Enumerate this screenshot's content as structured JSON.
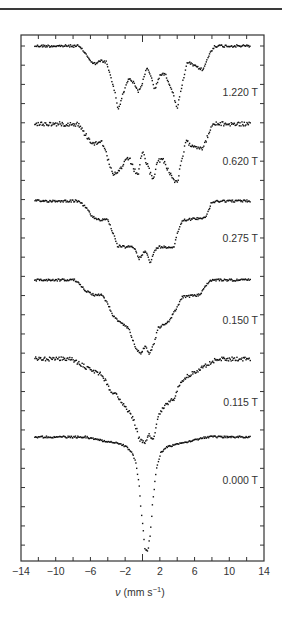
{
  "chart_data": {
    "type": "scatter",
    "title": "",
    "xlabel": "ν (mm s⁻¹)",
    "xlabel_parts": {
      "symbol": "ν",
      "unit_open": " (mm s",
      "exponent": "−1",
      "unit_close": ")"
    },
    "ylabel": "",
    "xlim": [
      -14,
      14
    ],
    "x_ticks": [
      -14,
      -10,
      -6,
      -2,
      2,
      6,
      10,
      14
    ],
    "x_tick_labels": [
      "−14",
      "−10",
      "−6",
      "−2",
      "2",
      "6",
      "10",
      "14"
    ],
    "x_minor_ticks": [
      -12,
      -10,
      -8,
      -6,
      -4,
      -2,
      0,
      2,
      4,
      6,
      8,
      10,
      12
    ],
    "grid": false,
    "legend_position": "inline-right",
    "y_tick_count": 27,
    "series": [
      {
        "name": "1.220 T",
        "baseline_px": 46,
        "label_y_px": 92,
        "profile": [
          [
            -12.5,
            0
          ],
          [
            -7.4,
            0
          ],
          [
            -6.8,
            5
          ],
          [
            -6.2,
            12
          ],
          [
            -5.7,
            18
          ],
          [
            -5.3,
            17
          ],
          [
            -4.8,
            15
          ],
          [
            -4.2,
            16
          ],
          [
            -3.7,
            30
          ],
          [
            -3.2,
            45
          ],
          [
            -2.8,
            64
          ],
          [
            -2.4,
            52
          ],
          [
            -1.6,
            32
          ],
          [
            -1.0,
            37
          ],
          [
            -0.5,
            46
          ],
          [
            0,
            37
          ],
          [
            0.5,
            22
          ],
          [
            1.0,
            30
          ],
          [
            1.4,
            44
          ],
          [
            2.0,
            29
          ],
          [
            2.6,
            28
          ],
          [
            3.4,
            44
          ],
          [
            4.0,
            62
          ],
          [
            4.3,
            50
          ],
          [
            4.7,
            34
          ],
          [
            5.2,
            16
          ],
          [
            6.0,
            20
          ],
          [
            7.0,
            24
          ],
          [
            7.6,
            10
          ],
          [
            8.3,
            0
          ],
          [
            12.5,
            0
          ]
        ],
        "noise": 1.2
      },
      {
        "name": "0.620 T",
        "baseline_px": 124,
        "label_y_px": 161,
        "profile": [
          [
            -12.5,
            0
          ],
          [
            -7.4,
            0
          ],
          [
            -6.8,
            8
          ],
          [
            -6.0,
            17
          ],
          [
            -5.4,
            20
          ],
          [
            -4.8,
            16
          ],
          [
            -4.3,
            24
          ],
          [
            -3.9,
            38
          ],
          [
            -3.4,
            52
          ],
          [
            -2.8,
            48
          ],
          [
            -2.0,
            38
          ],
          [
            -1.5,
            34
          ],
          [
            -1.0,
            46
          ],
          [
            -0.5,
            50
          ],
          [
            0,
            28
          ],
          [
            0.5,
            40
          ],
          [
            1.2,
            56
          ],
          [
            1.8,
            36
          ],
          [
            2.4,
            36
          ],
          [
            3.2,
            50
          ],
          [
            4.0,
            60
          ],
          [
            4.5,
            38
          ],
          [
            5.0,
            18
          ],
          [
            6.0,
            22
          ],
          [
            7.0,
            24
          ],
          [
            7.6,
            10
          ],
          [
            8.2,
            0
          ],
          [
            12.5,
            0
          ]
        ],
        "noise": 2.2
      },
      {
        "name": "0.275 T",
        "baseline_px": 201,
        "label_y_px": 238,
        "profile": [
          [
            -12.5,
            0
          ],
          [
            -7.5,
            0
          ],
          [
            -6.5,
            6
          ],
          [
            -5.8,
            16
          ],
          [
            -4.8,
            19
          ],
          [
            -4.0,
            18
          ],
          [
            -3.4,
            32
          ],
          [
            -2.9,
            45
          ],
          [
            -2.0,
            46
          ],
          [
            -1.0,
            46
          ],
          [
            -0.4,
            58
          ],
          [
            0.3,
            49
          ],
          [
            0.9,
            62
          ],
          [
            1.4,
            50
          ],
          [
            1.8,
            46
          ],
          [
            3.6,
            46
          ],
          [
            4.1,
            30
          ],
          [
            4.6,
            19
          ],
          [
            6.0,
            18
          ],
          [
            7.3,
            16
          ],
          [
            7.9,
            3
          ],
          [
            8.5,
            0
          ],
          [
            12.5,
            0
          ]
        ],
        "noise": 1.1
      },
      {
        "name": "0.150 T",
        "baseline_px": 280,
        "label_y_px": 320,
        "profile": [
          [
            -12.5,
            0
          ],
          [
            -7.8,
            0
          ],
          [
            -6.6,
            10
          ],
          [
            -5.6,
            15
          ],
          [
            -4.6,
            15
          ],
          [
            -4.0,
            24
          ],
          [
            -3.4,
            36
          ],
          [
            -2.4,
            44
          ],
          [
            -1.6,
            48
          ],
          [
            -0.8,
            68
          ],
          [
            -0.2,
            74
          ],
          [
            0.3,
            66
          ],
          [
            0.8,
            74
          ],
          [
            1.3,
            64
          ],
          [
            1.8,
            48
          ],
          [
            3.0,
            42
          ],
          [
            3.8,
            30
          ],
          [
            4.6,
            17
          ],
          [
            6.6,
            15
          ],
          [
            7.2,
            6
          ],
          [
            8.0,
            0
          ],
          [
            12.5,
            0
          ]
        ],
        "noise": 1.1
      },
      {
        "name": "0.115 T",
        "baseline_px": 359,
        "label_y_px": 402,
        "profile": [
          [
            -12.5,
            0
          ],
          [
            -8.2,
            0
          ],
          [
            -6.6,
            8
          ],
          [
            -4.6,
            16
          ],
          [
            -3.8,
            30
          ],
          [
            -2.8,
            38
          ],
          [
            -1.8,
            50
          ],
          [
            -1.0,
            60
          ],
          [
            -0.4,
            80
          ],
          [
            0.2,
            84
          ],
          [
            0.7,
            76
          ],
          [
            1.3,
            80
          ],
          [
            1.8,
            58
          ],
          [
            2.6,
            46
          ],
          [
            3.6,
            40
          ],
          [
            4.4,
            22
          ],
          [
            5.4,
            16
          ],
          [
            7.0,
            8
          ],
          [
            8.6,
            0
          ],
          [
            12.5,
            0
          ]
        ],
        "noise": 2.0
      },
      {
        "name": "0.000 T",
        "baseline_px": 437,
        "label_y_px": 480,
        "profile": [
          [
            -12.5,
            0
          ],
          [
            -6.5,
            0
          ],
          [
            -5.0,
            3
          ],
          [
            -3.0,
            6
          ],
          [
            -2.0,
            9
          ],
          [
            -1.3,
            14
          ],
          [
            -0.8,
            24
          ],
          [
            -0.4,
            48
          ],
          [
            -0.1,
            78
          ],
          [
            0.3,
            112
          ],
          [
            0.6,
            115
          ],
          [
            0.9,
            96
          ],
          [
            1.2,
            62
          ],
          [
            1.6,
            32
          ],
          [
            2.1,
            16
          ],
          [
            2.8,
            10
          ],
          [
            4.0,
            7
          ],
          [
            6.0,
            3
          ],
          [
            7.5,
            0
          ],
          [
            12.5,
            0
          ]
        ],
        "noise": 0.9
      }
    ]
  },
  "figure": {
    "frame": {
      "left_px": 21,
      "right_px": 264,
      "top_px": 35,
      "bottom_px": 561
    },
    "colors": {
      "points": "#111111",
      "axes": "#333333",
      "text": "#333333",
      "rule": "#3a3a3a"
    }
  }
}
